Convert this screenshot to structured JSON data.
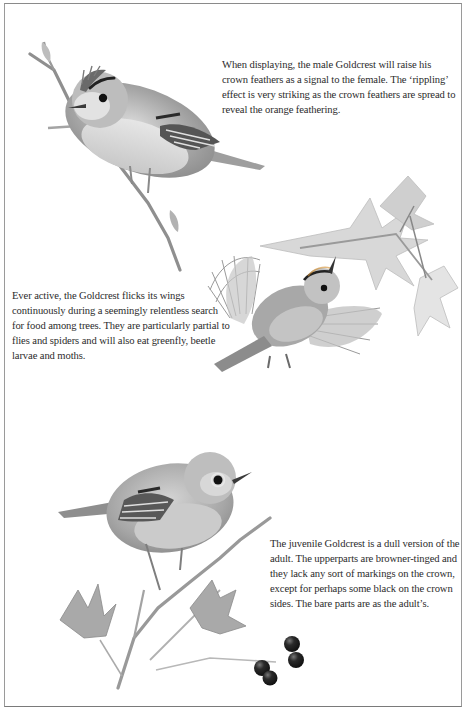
{
  "page": {
    "border_color": "#8a8a8a",
    "background": "#ffffff"
  },
  "captions": {
    "displaying": "When displaying, the male Goldcrest will raise his crown feathers as a signal to the female. The ‘rippling’ effect is very striking as the crown feathers are spread to reveal the orange feathering.",
    "active": "Ever active, the Goldcrest flicks its wings continuously during a seemingly relentless search for food among trees. They are particularly partial to flies and spiders and will also eat greenfly, beetle larvae and moths.",
    "juvenile": "The juvenile Goldcrest is a dull version of the adult. The upperparts are browner-tinged and they lack any sort of markings on the crown, except for perhaps some black on the crown sides. The bare parts are as the adult’s."
  },
  "illustrations": [
    {
      "id": "male-displaying",
      "subject": "Goldcrest perched on twig with raised crown feathers"
    },
    {
      "id": "wing-flicking",
      "subject": "Goldcrest with spread wings beneath maple leaves"
    },
    {
      "id": "juvenile",
      "subject": "Juvenile Goldcrest perched on branch with leaves and dark berries"
    }
  ]
}
